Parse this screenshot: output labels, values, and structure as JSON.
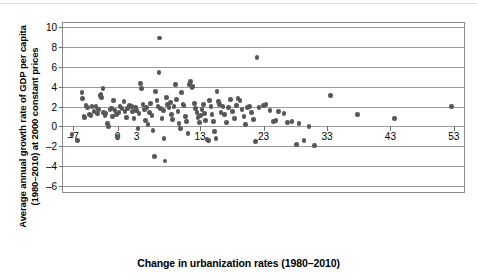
{
  "figure": {
    "background": "#ffffff",
    "frame_color": "#8a8a8a",
    "gridline_color": "#9b9b9b",
    "marker_color": "#575757"
  },
  "chart_data": {
    "type": "scatter",
    "title": "",
    "xlabel": "Change in urbanization rates (1980–2010)",
    "ylabel_line1": "Average annual growth rate of GDP per capita",
    "ylabel_line2": "(1980–2010) at 2000 constant prices",
    "ylabel": "Average annual growth rate of GDP per capita (1980–2010) at 2000 constant prices",
    "xlim": [
      -8.6,
      54.6
    ],
    "ylim": [
      -6.6,
      10.4
    ],
    "xticks": [
      -7,
      0,
      3,
      13,
      23,
      33,
      43,
      53
    ],
    "xticklabels": [
      "–7",
      "0",
      "3",
      "13",
      "23",
      "33",
      "43",
      "53"
    ],
    "yticks": [
      -6,
      -4,
      -2,
      0,
      2,
      4,
      6,
      8,
      10
    ],
    "yticklabels": [
      "–6",
      "–4",
      "–2",
      "0",
      "2",
      "4",
      "6",
      "8",
      "10"
    ],
    "grid": "horizontal",
    "legend": "none",
    "marker_size": 4.6,
    "points": [
      [
        -7.2,
        -0.8
      ],
      [
        -6.3,
        -1.4
      ],
      [
        -5.6,
        3.4
      ],
      [
        -5.5,
        2.8
      ],
      [
        -5.3,
        1.0
      ],
      [
        -5.2,
        0.9
      ],
      [
        -5.0,
        2.1
      ],
      [
        -4.7,
        1.9
      ],
      [
        -4.4,
        1.2
      ],
      [
        -4.2,
        1.1
      ],
      [
        -4.0,
        2.0
      ],
      [
        -3.7,
        1.5
      ],
      [
        -3.4,
        2.0
      ],
      [
        -3.2,
        1.3
      ],
      [
        -3.0,
        1.7
      ],
      [
        -2.8,
        3.1
      ],
      [
        -2.6,
        3.2
      ],
      [
        -2.5,
        2.9
      ],
      [
        -2.3,
        3.8
      ],
      [
        -2.2,
        1.4
      ],
      [
        -2.0,
        1.1
      ],
      [
        -1.8,
        1.3
      ],
      [
        -1.6,
        0.3
      ],
      [
        -1.4,
        0.0
      ],
      [
        -1.2,
        1.7
      ],
      [
        -1.0,
        1.8
      ],
      [
        -0.8,
        1.0
      ],
      [
        -0.6,
        2.6
      ],
      [
        -0.4,
        1.6
      ],
      [
        -0.2,
        1.2
      ],
      [
        0.0,
        -1.0
      ],
      [
        0.2,
        1.4
      ],
      [
        0.4,
        2.0
      ],
      [
        0.7,
        1.8
      ],
      [
        1.0,
        2.5
      ],
      [
        1.2,
        1.5
      ],
      [
        1.4,
        0.9
      ],
      [
        1.6,
        1.8
      ],
      [
        1.9,
        2.1
      ],
      [
        2.2,
        2.0
      ],
      [
        2.4,
        1.5
      ],
      [
        2.6,
        0.8
      ],
      [
        2.8,
        1.9
      ],
      [
        3.0,
        1.6
      ],
      [
        3.2,
        -0.2
      ],
      [
        3.4,
        1.3
      ],
      [
        3.6,
        4.3
      ],
      [
        3.8,
        3.8
      ],
      [
        4.0,
        2.2
      ],
      [
        4.2,
        1.7
      ],
      [
        4.4,
        0.6
      ],
      [
        4.6,
        1.9
      ],
      [
        4.8,
        0.2
      ],
      [
        5.0,
        1.4
      ],
      [
        5.2,
        2.3
      ],
      [
        5.4,
        1.1
      ],
      [
        5.6,
        -0.4
      ],
      [
        5.8,
        -3.0
      ],
      [
        6.0,
        3.5
      ],
      [
        6.2,
        2.6
      ],
      [
        6.4,
        2.0
      ],
      [
        6.5,
        5.4
      ],
      [
        6.6,
        8.9
      ],
      [
        6.8,
        1.8
      ],
      [
        7.0,
        0.8
      ],
      [
        7.2,
        1.6
      ],
      [
        7.3,
        -1.2
      ],
      [
        7.5,
        -3.5
      ],
      [
        7.7,
        2.9
      ],
      [
        7.9,
        2.2
      ],
      [
        8.1,
        1.9
      ],
      [
        8.3,
        2.4
      ],
      [
        8.5,
        1.2
      ],
      [
        8.7,
        0.7
      ],
      [
        8.9,
        2.0
      ],
      [
        9.1,
        4.2
      ],
      [
        9.3,
        2.7
      ],
      [
        9.5,
        1.5
      ],
      [
        9.7,
        0.3
      ],
      [
        9.9,
        -0.2
      ],
      [
        10.1,
        3.4
      ],
      [
        10.3,
        2.2
      ],
      [
        10.5,
        2.1
      ],
      [
        10.7,
        1.0
      ],
      [
        10.9,
        0.5
      ],
      [
        11.1,
        -0.7
      ],
      [
        11.3,
        4.2
      ],
      [
        11.5,
        4.5
      ],
      [
        11.7,
        3.9
      ],
      [
        11.9,
        4.0
      ],
      [
        12.1,
        2.3
      ],
      [
        12.3,
        1.8
      ],
      [
        12.5,
        1.4
      ],
      [
        12.7,
        0.9
      ],
      [
        12.9,
        0.4
      ],
      [
        13.1,
        1.1
      ],
      [
        13.3,
        1.7
      ],
      [
        13.5,
        2.2
      ],
      [
        13.7,
        1.3
      ],
      [
        13.9,
        0.6
      ],
      [
        14.1,
        -1.3
      ],
      [
        14.3,
        -1.4
      ],
      [
        14.5,
        2.6
      ],
      [
        14.7,
        2.0
      ],
      [
        14.9,
        1.2
      ],
      [
        15.1,
        0.5
      ],
      [
        15.3,
        -0.5
      ],
      [
        15.5,
        -1.2
      ],
      [
        15.7,
        3.5
      ],
      [
        15.9,
        2.5
      ],
      [
        16.1,
        2.2
      ],
      [
        16.3,
        1.4
      ],
      [
        16.6,
        2.0
      ],
      [
        16.9,
        1.2
      ],
      [
        17.2,
        0.4
      ],
      [
        17.5,
        1.9
      ],
      [
        17.8,
        2.7
      ],
      [
        18.1,
        1.5
      ],
      [
        18.4,
        0.8
      ],
      [
        18.7,
        2.1
      ],
      [
        19.0,
        2.8
      ],
      [
        19.3,
        2.6
      ],
      [
        19.6,
        1.7
      ],
      [
        19.9,
        1.0
      ],
      [
        20.2,
        0.2
      ],
      [
        20.5,
        1.9
      ],
      [
        20.8,
        2.0
      ],
      [
        21.1,
        1.4
      ],
      [
        21.4,
        0.7
      ],
      [
        21.7,
        -1.5
      ],
      [
        22.0,
        6.9
      ],
      [
        22.3,
        1.9
      ],
      [
        23.0,
        2.1
      ],
      [
        23.4,
        2.2
      ],
      [
        24.0,
        1.6
      ],
      [
        24.6,
        0.5
      ],
      [
        25.0,
        0.6
      ],
      [
        25.4,
        1.5
      ],
      [
        26.2,
        1.3
      ],
      [
        26.8,
        0.4
      ],
      [
        27.5,
        0.5
      ],
      [
        28.2,
        -1.8
      ],
      [
        28.6,
        0.3
      ],
      [
        29.4,
        -1.4
      ],
      [
        30.2,
        0.0
      ],
      [
        31.0,
        -1.9
      ],
      [
        33.6,
        3.1
      ],
      [
        37.8,
        1.2
      ],
      [
        43.6,
        0.8
      ],
      [
        52.6,
        2.0
      ]
    ]
  }
}
